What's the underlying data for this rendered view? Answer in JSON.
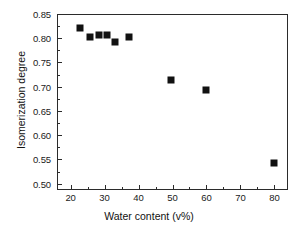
{
  "chart_data": {
    "type": "scatter",
    "title": "",
    "xlabel": "Water content (v%)",
    "ylabel": "Isomerization degree",
    "xlim": [
      16,
      84
    ],
    "ylim": [
      0.487,
      0.85
    ],
    "grid": false,
    "legend": null,
    "marker": "filled-square",
    "marker_color": "#111111",
    "xticks": [
      20,
      30,
      40,
      50,
      60,
      70,
      80
    ],
    "xticklabels": [
      "20",
      "30",
      "40",
      "50",
      "60",
      "70",
      "80"
    ],
    "yticks": [
      0.5,
      0.55,
      0.6,
      0.65,
      0.7,
      0.75,
      0.8,
      0.85
    ],
    "yticklabels": [
      "0.50",
      "0.55",
      "0.60",
      "0.65",
      "0.70",
      "0.75",
      "0.80",
      "0.85"
    ],
    "x": [
      22.7,
      25.8,
      28.5,
      30.7,
      33.2,
      37.3,
      49.7,
      59.8,
      80.0
    ],
    "y": [
      0.822,
      0.803,
      0.806,
      0.806,
      0.792,
      0.803,
      0.714,
      0.693,
      0.542
    ],
    "series": [
      {
        "name": "Isomerization degree vs water content",
        "points": [
          {
            "x": 22.7,
            "y": 0.822
          },
          {
            "x": 25.8,
            "y": 0.803
          },
          {
            "x": 28.5,
            "y": 0.806
          },
          {
            "x": 30.7,
            "y": 0.806
          },
          {
            "x": 33.2,
            "y": 0.792
          },
          {
            "x": 37.3,
            "y": 0.803
          },
          {
            "x": 49.7,
            "y": 0.714
          },
          {
            "x": 59.8,
            "y": 0.693
          },
          {
            "x": 80.0,
            "y": 0.542
          }
        ]
      }
    ]
  }
}
